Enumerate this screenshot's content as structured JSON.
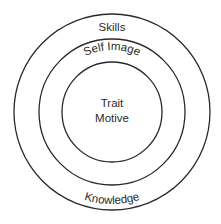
{
  "diagram": {
    "type": "concentric-circles",
    "colors": {
      "stroke": "#2a2a2a",
      "background": "#ffffff",
      "text": "#2a2a2a"
    },
    "rings": [
      {
        "name": "outer",
        "top_label": "Skills",
        "bottom_label": "Knowledge"
      },
      {
        "name": "middle",
        "top_label": "Self Image"
      },
      {
        "name": "core",
        "center_lines": [
          "Trait",
          "Motive"
        ]
      }
    ]
  }
}
